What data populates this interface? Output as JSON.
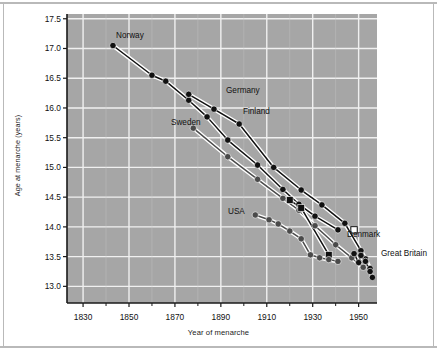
{
  "chart_data": {
    "type": "line",
    "title": "",
    "xlabel": "Year of menarche",
    "ylabel": "Age at menarche (years)",
    "xlim": [
      1823,
      1958
    ],
    "ylim": [
      12.72,
      17.58
    ],
    "grid": true,
    "legend_position": "inline-labels",
    "xticks": [
      1830,
      1850,
      1870,
      1890,
      1910,
      1930,
      1950
    ],
    "yticks": [
      13.0,
      13.5,
      14.0,
      14.5,
      15.0,
      15.5,
      16.0,
      16.5,
      17.0,
      17.5
    ],
    "plot_background": "#a6a6a6",
    "gridline_color": "#f0f0f0",
    "series": [
      {
        "name": "Norway",
        "marker": "circle-filled",
        "color": "#111111",
        "points": [
          [
            1843,
            17.05
          ],
          [
            1860,
            16.55
          ],
          [
            1866,
            16.45
          ],
          [
            1876,
            16.13
          ],
          [
            1884,
            15.85
          ],
          [
            1893,
            15.46
          ],
          [
            1906,
            15.04
          ],
          [
            1917,
            14.63
          ],
          [
            1924,
            14.38
          ],
          [
            1931,
            14.18
          ],
          [
            1941,
            13.95
          ]
        ]
      },
      {
        "name": "Sweden",
        "marker": "circle-filled",
        "color": "#4a4a4a",
        "points": [
          [
            1878,
            15.66
          ],
          [
            1893,
            15.18
          ],
          [
            1906,
            14.8
          ],
          [
            1917,
            14.48
          ],
          [
            1924,
            14.28
          ],
          [
            1931,
            14.02
          ],
          [
            1940,
            13.7
          ],
          [
            1947,
            13.48
          ],
          [
            1952,
            13.32
          ]
        ]
      },
      {
        "name": "Finland",
        "marker": "circle-filled",
        "color": "#111111",
        "points": [
          [
            1876,
            16.23
          ],
          [
            1887,
            15.98
          ],
          [
            1898,
            15.73
          ],
          [
            1913,
            15.0
          ],
          [
            1925,
            14.62
          ],
          [
            1934,
            14.37
          ],
          [
            1944,
            14.06
          ],
          [
            1951,
            13.6
          ],
          [
            1953,
            13.46
          ],
          [
            1955,
            13.3
          ]
        ]
      },
      {
        "name": "Germany",
        "marker": "square-filled",
        "color": "#111111",
        "points": [
          [
            1920,
            14.45
          ],
          [
            1925,
            14.32
          ],
          [
            1937,
            13.53
          ]
        ]
      },
      {
        "name": "USA",
        "marker": "circle-filled",
        "color": "#4a4a4a",
        "points": [
          [
            1905,
            14.2
          ],
          [
            1911,
            14.12
          ],
          [
            1915,
            14.05
          ],
          [
            1920,
            13.93
          ],
          [
            1925,
            13.8
          ],
          [
            1929,
            13.53
          ],
          [
            1933,
            13.48
          ],
          [
            1937,
            13.45
          ],
          [
            1941,
            13.42
          ]
        ]
      },
      {
        "name": "Denmark",
        "marker": "square-open",
        "color": "#111111",
        "points": [
          [
            1948,
            13.95
          ]
        ]
      },
      {
        "name": "Great Britain",
        "marker": "circle-filled",
        "color": "#111111",
        "points": [
          [
            1948,
            13.55
          ],
          [
            1950,
            13.4
          ],
          [
            1951,
            13.52
          ],
          [
            1953,
            13.42
          ],
          [
            1955,
            13.25
          ],
          [
            1956,
            13.15
          ]
        ]
      }
    ],
    "annotations": [
      {
        "text": "Norway",
        "x_px": 116,
        "y_px": 31
      },
      {
        "text": "Germany",
        "x_px": 226,
        "y_px": 86
      },
      {
        "text": "Finland",
        "x_px": 243,
        "y_px": 107
      },
      {
        "text": "Sweden",
        "x_px": 171,
        "y_px": 118
      },
      {
        "text": "USA",
        "x_px": 228,
        "y_px": 207
      },
      {
        "text": "Denmark",
        "x_px": 347,
        "y_px": 230
      },
      {
        "text": "Great Britain",
        "x_px": 381,
        "y_px": 249
      }
    ]
  },
  "axes": {
    "y_tick_labels": [
      "17.5",
      "17.0",
      "16.5",
      "16.0",
      "15.5",
      "15.0",
      "14.5",
      "14.0",
      "13.5",
      "13.0"
    ],
    "x_tick_labels": [
      "1830",
      "1850",
      "1870",
      "1890",
      "1910",
      "1930",
      "1950"
    ],
    "x_axis_title": "Year of menarche",
    "y_axis_title": "Age at menarche (years)"
  }
}
